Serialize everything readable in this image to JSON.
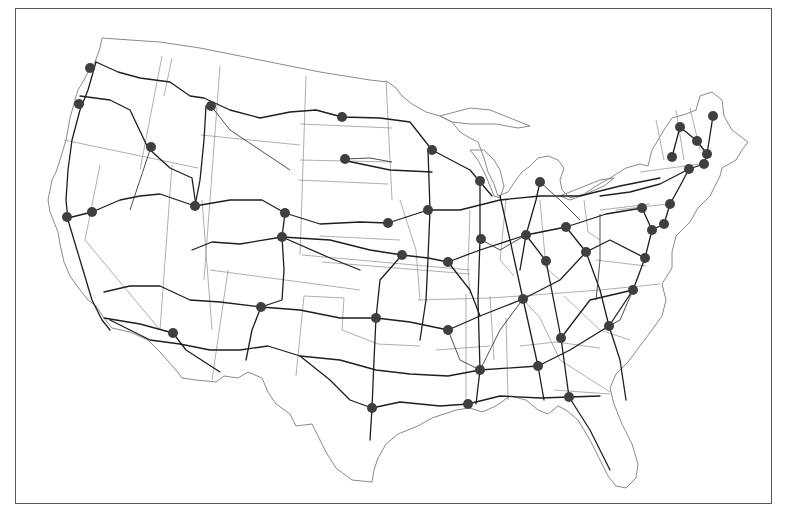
{
  "map": {
    "type": "us-highway-network",
    "background_color": "#ffffff",
    "frame_color": "#555555",
    "marker_color": "#3f3f3f",
    "marker_radius": 5,
    "markers": [
      {
        "id": "m1",
        "x": 90,
        "y": 68
      },
      {
        "id": "m2",
        "x": 79,
        "y": 104
      },
      {
        "id": "m3",
        "x": 151,
        "y": 147
      },
      {
        "id": "m4",
        "x": 211,
        "y": 106
      },
      {
        "id": "m5",
        "x": 342,
        "y": 117
      },
      {
        "id": "m6",
        "x": 345,
        "y": 159
      },
      {
        "id": "m7",
        "x": 67,
        "y": 217
      },
      {
        "id": "m8",
        "x": 92,
        "y": 212
      },
      {
        "id": "m9",
        "x": 195,
        "y": 206
      },
      {
        "id": "m10",
        "x": 285,
        "y": 213
      },
      {
        "id": "m11",
        "x": 282,
        "y": 237
      },
      {
        "id": "m12",
        "x": 261,
        "y": 307
      },
      {
        "id": "m13",
        "x": 173,
        "y": 333
      },
      {
        "id": "m14",
        "x": 432,
        "y": 150
      },
      {
        "id": "m15",
        "x": 428,
        "y": 210
      },
      {
        "id": "m16",
        "x": 388,
        "y": 223
      },
      {
        "id": "m17",
        "x": 402,
        "y": 255
      },
      {
        "id": "m18",
        "x": 448,
        "y": 262
      },
      {
        "id": "m19",
        "x": 480,
        "y": 181
      },
      {
        "id": "m20",
        "x": 540,
        "y": 182
      },
      {
        "id": "m21",
        "x": 481,
        "y": 239
      },
      {
        "id": "m22",
        "x": 526,
        "y": 235
      },
      {
        "id": "m23",
        "x": 566,
        "y": 227
      },
      {
        "id": "m24",
        "x": 546,
        "y": 261
      },
      {
        "id": "m25",
        "x": 586,
        "y": 252
      },
      {
        "id": "m26",
        "x": 713,
        "y": 116
      },
      {
        "id": "m27",
        "x": 680,
        "y": 127
      },
      {
        "id": "m28",
        "x": 697,
        "y": 141
      },
      {
        "id": "m29",
        "x": 707,
        "y": 154
      },
      {
        "id": "m30",
        "x": 704,
        "y": 164
      },
      {
        "id": "m31",
        "x": 672,
        "y": 157
      },
      {
        "id": "m32",
        "x": 689,
        "y": 169
      },
      {
        "id": "m33",
        "x": 642,
        "y": 208
      },
      {
        "id": "m34",
        "x": 670,
        "y": 204
      },
      {
        "id": "m35",
        "x": 664,
        "y": 224
      },
      {
        "id": "m36",
        "x": 652,
        "y": 230
      },
      {
        "id": "m37",
        "x": 645,
        "y": 258
      },
      {
        "id": "m38",
        "x": 633,
        "y": 290
      },
      {
        "id": "m39",
        "x": 376,
        "y": 318
      },
      {
        "id": "m40",
        "x": 448,
        "y": 330
      },
      {
        "id": "m41",
        "x": 523,
        "y": 299
      },
      {
        "id": "m42",
        "x": 561,
        "y": 338
      },
      {
        "id": "m43",
        "x": 609,
        "y": 326
      },
      {
        "id": "m44",
        "x": 538,
        "y": 366
      },
      {
        "id": "m45",
        "x": 480,
        "y": 370
      },
      {
        "id": "m46",
        "x": 468,
        "y": 404
      },
      {
        "id": "m47",
        "x": 372,
        "y": 408
      },
      {
        "id": "m48",
        "x": 569,
        "y": 397
      }
    ]
  }
}
